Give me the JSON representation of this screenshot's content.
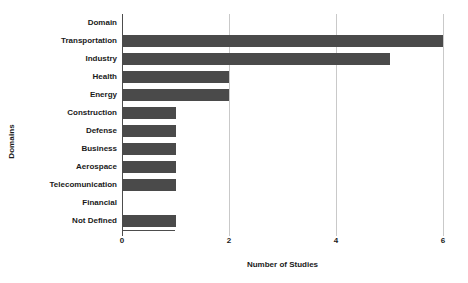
{
  "chart_data": {
    "type": "bar",
    "orientation": "horizontal",
    "title": "",
    "xlabel": "Number of Studies",
    "ylabel": "Domains",
    "categories": [
      "Domain",
      "Transportation",
      "Industry",
      "Health",
      "Energy",
      "Construction",
      "Defense",
      "Business",
      "Aerospace",
      "Telecomunication",
      "Financial",
      "Not Defined"
    ],
    "values": [
      0,
      6,
      5,
      2,
      2,
      1,
      1,
      1,
      1,
      1,
      0,
      1
    ],
    "xlim": [
      0,
      6
    ],
    "xticks": [
      0,
      2,
      4,
      6
    ],
    "xtick_labels": [
      "0",
      "2",
      "4",
      "6"
    ],
    "grid": true,
    "grid_axis": "x",
    "legend": "none",
    "bar_color": "#4a4a4a",
    "grid_color": "#c9c9c9",
    "axis_color": "#4d4d4d",
    "background": "#ffffff"
  }
}
